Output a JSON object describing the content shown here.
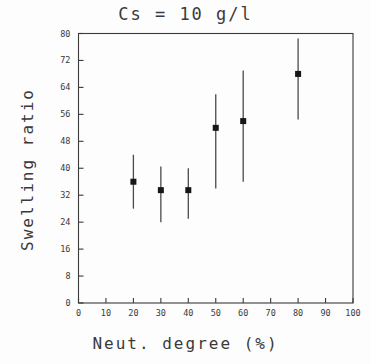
{
  "chart_data": {
    "type": "scatter",
    "title": "Cs = 10 g/l",
    "xlabel": "Neut. degree (%)",
    "ylabel": "Swelling ratio",
    "xlim": [
      0,
      100
    ],
    "ylim": [
      0,
      80
    ],
    "xticks": [
      0,
      10,
      20,
      30,
      40,
      50,
      60,
      70,
      80,
      90,
      100
    ],
    "yticks": [
      0,
      8,
      16,
      24,
      32,
      40,
      48,
      56,
      64,
      72,
      80
    ],
    "xtick_labels": [
      "0",
      "10",
      "20",
      "30",
      "40",
      "50",
      "60",
      "70",
      "80",
      "90",
      "100"
    ],
    "ytick_labels": [
      "0",
      "8",
      "16",
      "24",
      "32",
      "40",
      "48",
      "56",
      "64",
      "72",
      "80"
    ],
    "grid": false,
    "legend": null,
    "marker": "filled-square",
    "errorbars": true,
    "x": [
      20,
      30,
      40,
      50,
      60,
      80
    ],
    "values": [
      36,
      33.5,
      33.5,
      52,
      54,
      68
    ],
    "y_lower": [
      28,
      24,
      25,
      34,
      36,
      54.5
    ],
    "y_upper": [
      44,
      40.5,
      40,
      62,
      69,
      78.5
    ],
    "points": [
      {
        "x": 20,
        "y": 36,
        "low": 28,
        "high": 44
      },
      {
        "x": 30,
        "y": 33.5,
        "low": 24,
        "high": 40.5
      },
      {
        "x": 40,
        "y": 33.5,
        "low": 25,
        "high": 40
      },
      {
        "x": 50,
        "y": 52,
        "low": 34,
        "high": 62
      },
      {
        "x": 60,
        "y": 54,
        "low": 36,
        "high": 69
      },
      {
        "x": 80,
        "y": 68,
        "low": 54.5,
        "high": 78.5
      }
    ]
  },
  "colors": {
    "background": "#fdfdfd",
    "axis": "#3a3a3a",
    "marker": "#161616",
    "errorbar": "#4a4a4a",
    "text": "#3a3a3a"
  },
  "figure": {
    "title": "Cs = 10 g/l",
    "x_axis_title": "Neut. degree (%)",
    "y_axis_title": "Swelling ratio"
  }
}
